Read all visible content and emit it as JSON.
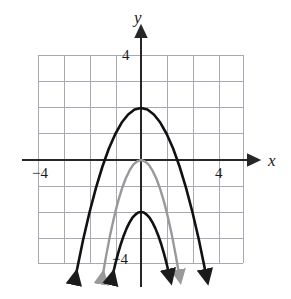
{
  "figure": {
    "kind": "coordinate-plane-graph"
  },
  "axes": {
    "x_axis_name": "x",
    "y_axis_name": "y",
    "x_tick_negative": "−4",
    "x_tick_positive": "4",
    "y_tick_positive": "4",
    "y_tick_negative": "−4"
  },
  "colors": {
    "grid": "#a9a9b4",
    "axis": "#262626",
    "curve_dark": "#111111",
    "curve_gray": "#999999",
    "background": "#ffffff"
  },
  "chart_data": {
    "type": "line",
    "title": "",
    "xlabel": "x",
    "ylabel": "y",
    "xlim": [
      -4,
      4
    ],
    "ylim": [
      -4,
      4
    ],
    "grid": true,
    "legend": "none",
    "xticks": [
      -4,
      4
    ],
    "yticks": [
      4,
      -4
    ],
    "annotations": [
      {
        "text": "−4",
        "x": -3.7,
        "y": -0.45
      },
      {
        "text": "4",
        "x": 3.7,
        "y": -0.45
      },
      {
        "text": "4",
        "x": -0.5,
        "y": 3.75
      },
      {
        "text": "−4",
        "x": -0.75,
        "y": -3.6
      },
      {
        "text": "x",
        "x": 4.6,
        "y": -0.05
      },
      {
        "text": "y",
        "x": 0.05,
        "y": 4.85
      }
    ],
    "series": [
      {
        "name": "outer dark parabola",
        "color": "#111111",
        "style": "solid",
        "linewidth": 2.6,
        "arrow_ends": "both-downward",
        "equation": "y = -x^2 + 2",
        "vertex": [
          0,
          2
        ],
        "x": [
          -2.55,
          -2.25,
          -2.0,
          -1.75,
          -1.5,
          -1.25,
          -1.0,
          -0.75,
          -0.5,
          -0.25,
          0,
          0.25,
          0.5,
          0.75,
          1.0,
          1.25,
          1.5,
          1.75,
          2.0,
          2.25,
          2.55
        ],
        "values": [
          -4.5,
          -3.06,
          -2.0,
          -1.06,
          -0.25,
          0.44,
          1.0,
          1.44,
          1.75,
          1.94,
          2.0,
          1.94,
          1.75,
          1.44,
          1.0,
          0.44,
          -0.25,
          -1.06,
          -2.0,
          -3.06,
          -4.5
        ]
      },
      {
        "name": "middle gray parabola",
        "color": "#999999",
        "style": "solid",
        "linewidth": 2.4,
        "arrow_ends": "both-downward",
        "equation": "y = -2x^2",
        "vertex": [
          0,
          0
        ],
        "x": [
          -1.5,
          -1.35,
          -1.2,
          -1.05,
          -0.9,
          -0.75,
          -0.6,
          -0.45,
          -0.3,
          -0.15,
          0,
          0.15,
          0.3,
          0.45,
          0.6,
          0.75,
          0.9,
          1.05,
          1.2,
          1.35,
          1.5
        ],
        "values": [
          -4.5,
          -3.65,
          -2.88,
          -2.21,
          -1.62,
          -1.13,
          -0.72,
          -0.41,
          -0.18,
          -0.05,
          0,
          -0.05,
          -0.18,
          -0.41,
          -0.72,
          -1.13,
          -1.62,
          -2.21,
          -2.88,
          -3.65,
          -4.5
        ]
      },
      {
        "name": "inner dark parabola",
        "color": "#111111",
        "style": "solid",
        "linewidth": 2.6,
        "arrow_ends": "both-downward",
        "equation": "y = -2x^2 - 2",
        "vertex": [
          0,
          -2
        ],
        "x": [
          -1.12,
          -1.0,
          -0.9,
          -0.78,
          -0.67,
          -0.56,
          -0.45,
          -0.34,
          -0.22,
          -0.11,
          0,
          0.11,
          0.22,
          0.34,
          0.45,
          0.56,
          0.67,
          0.78,
          0.9,
          1.0,
          1.12
        ],
        "values": [
          -4.5,
          -4.0,
          -3.62,
          -3.22,
          -2.9,
          -2.63,
          -2.41,
          -2.23,
          -2.1,
          -2.02,
          -2.0,
          -2.02,
          -2.1,
          -2.23,
          -2.41,
          -2.63,
          -2.9,
          -3.22,
          -3.62,
          -4.0,
          -4.5
        ]
      }
    ]
  }
}
